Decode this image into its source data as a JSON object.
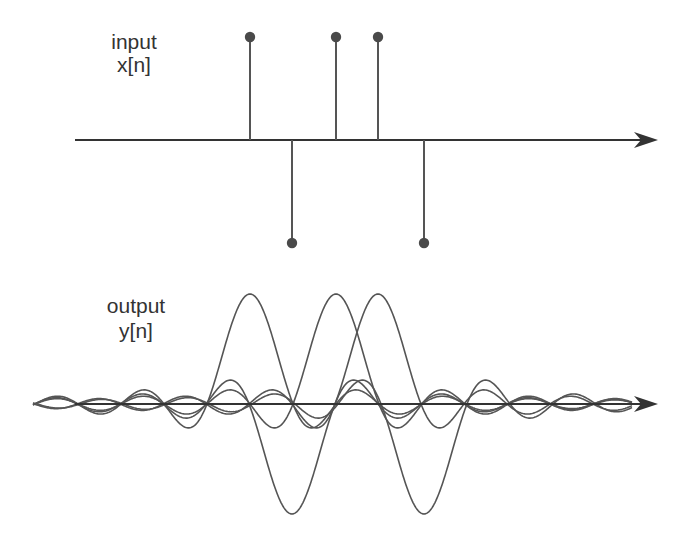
{
  "input_panel": {
    "label_line1": "input",
    "label_line2": "x[n]"
  },
  "output_panel": {
    "label_line1": "output",
    "label_line2": "y[n]"
  },
  "colors": {
    "stroke": "#555555",
    "axis": "#333333",
    "dot": "#4a4a4a",
    "text": "#333333"
  },
  "chart_data": [
    {
      "type": "stem",
      "title": "input x[n]",
      "description": "Discrete-time input: five impulses with alternating signs",
      "n": [
        0,
        1,
        2,
        3,
        4
      ],
      "values": [
        1,
        -1,
        1,
        1,
        -1
      ],
      "axis": "horizontal arrow, no ticks"
    },
    {
      "type": "line",
      "title": "output y[n]",
      "description": "Sum of shifted and scaled sinc pulses, one per input impulse",
      "centers_n": [
        0,
        1,
        2,
        3,
        4
      ],
      "amplitudes": [
        1,
        -1,
        1,
        1,
        -1
      ],
      "kernel": "sinc",
      "axis": "horizontal arrow, no ticks"
    }
  ],
  "geometry": {
    "spacing_px": 43,
    "centers_px": [
      250,
      292,
      336,
      378,
      424
    ],
    "top_axis_y": 140,
    "top_stem_height": 103,
    "bottom_axis_y": 404,
    "sinc_amplitude_px": 110,
    "axis_start_x": 75,
    "arrow_tip_x": 658,
    "curve_start_x": 33,
    "curve_end_x": 632
  }
}
